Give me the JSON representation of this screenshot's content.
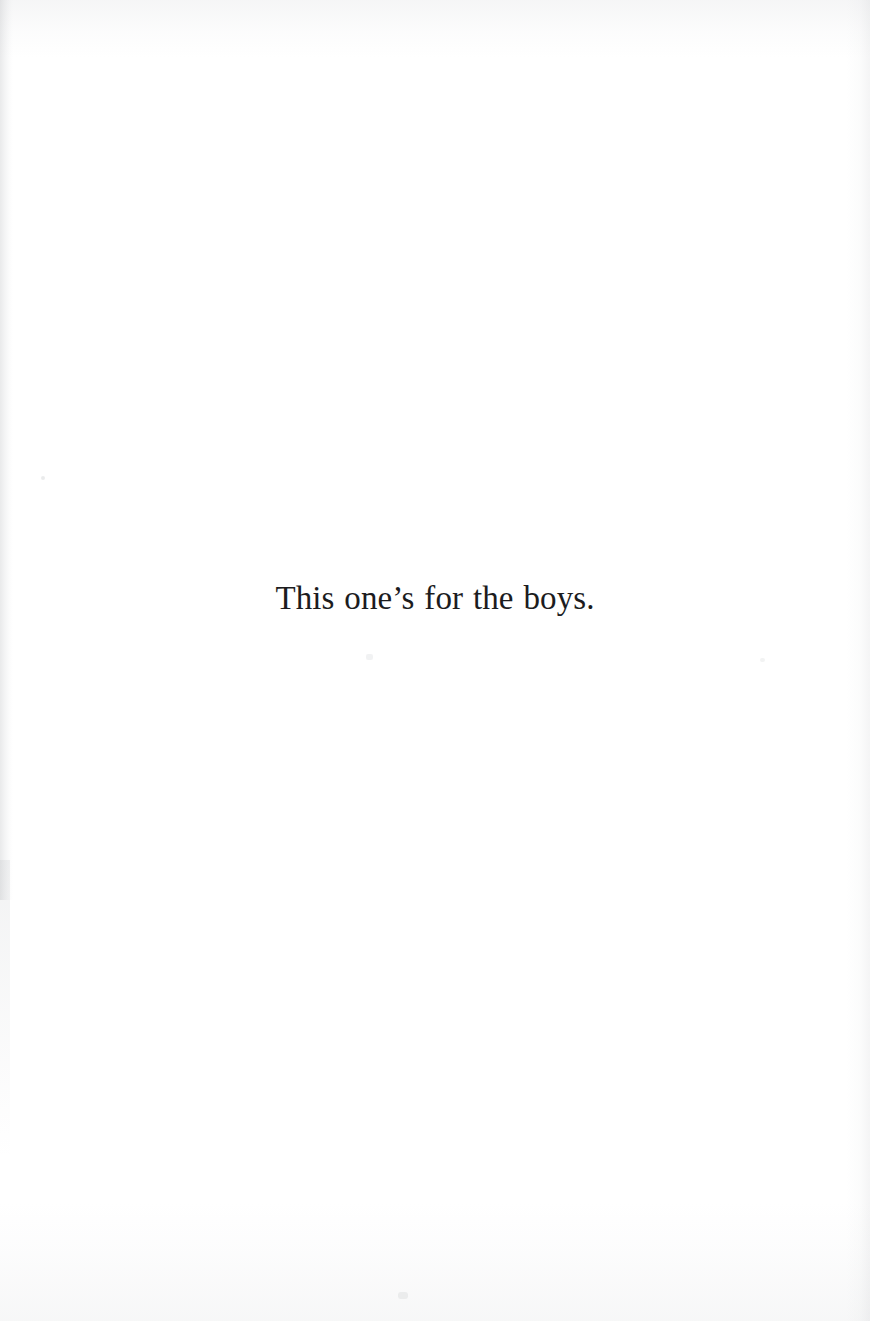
{
  "page": {
    "kind": "book-dedication-page",
    "background_color": "#ffffff",
    "text_color": "#1c1c1e",
    "width_px": 870,
    "height_px": 1321
  },
  "dedication": {
    "text": "This one’s for the boys."
  },
  "artifacts": {
    "left_edge_label": "scan gutter shadow",
    "right_edge_label": "scan edge noise",
    "top_edge_label": "scan top noise",
    "bottom_edge_label": "scan bottom noise"
  }
}
